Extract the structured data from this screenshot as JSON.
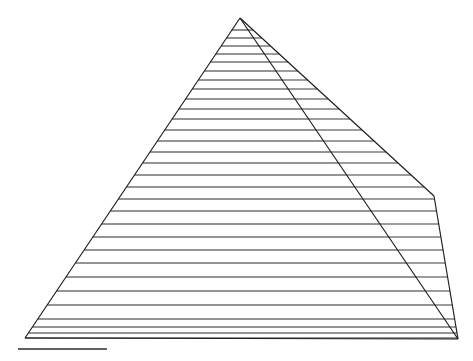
{
  "figure": {
    "caption": "",
    "background_color": "#ffffff",
    "line_color": "#1c1c1c",
    "canvas": {
      "width": 473,
      "height": 361
    }
  },
  "chart_data": {
    "type": "line",
    "subtitle": "",
    "xlabel": "",
    "ylabel": "",
    "grid": false,
    "legend_position": "none",
    "xlim": [
      0,
      473
    ],
    "ylim": [
      0,
      361
    ],
    "annotations": [
      {
        "name": "apex",
        "x": 240,
        "y": 18
      },
      {
        "name": "left-base-corner",
        "x": 25,
        "y": 338
      },
      {
        "name": "front-right-base-corner",
        "x": 458,
        "y": 339
      },
      {
        "name": "right-face-upper-corner",
        "x": 434,
        "y": 196
      },
      {
        "name": "scalebar-left",
        "x": 18,
        "y": 349
      },
      {
        "name": "scalebar-right",
        "x": 107,
        "y": 349
      }
    ],
    "geometry": {
      "apex": [
        240,
        18
      ],
      "base_left": [
        25,
        338
      ],
      "base_right": [
        458,
        339
      ],
      "ridge_foot": [
        434,
        196
      ],
      "front_face_edges": [
        [
          [
            240,
            18
          ],
          [
            25,
            338
          ]
        ],
        [
          [
            240,
            18
          ],
          [
            458,
            339
          ]
        ]
      ],
      "right_face_edges": [
        [
          [
            240,
            18
          ],
          [
            434,
            196
          ]
        ],
        [
          [
            434,
            196
          ],
          [
            458,
            339
          ]
        ]
      ],
      "base_edge": [
        [
          25,
          338
        ],
        [
          458,
          339
        ]
      ]
    },
    "step_count": 30,
    "step_line_y": [
      30,
      38,
      46,
      54,
      62,
      71,
      80,
      89,
      99,
      109,
      119,
      130,
      141,
      152,
      163,
      175,
      187,
      199,
      211,
      224,
      237,
      250,
      263,
      277,
      291,
      305,
      319,
      327,
      333,
      338
    ],
    "riser_count": 29,
    "scale_bar": {
      "x1": 18,
      "y1": 349,
      "x2": 107,
      "y2": 349,
      "label": ""
    }
  }
}
